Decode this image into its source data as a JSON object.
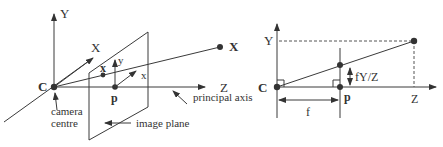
{
  "left_diagram": {
    "axis_labels": {
      "y": "Y",
      "x": "X",
      "z": "Z"
    },
    "camera_centre_point": "C",
    "principal_point": "p",
    "world_point": "X",
    "image_point": "x",
    "image_axes": {
      "x": "x",
      "y": "y"
    },
    "annotations": {
      "camera_centre": [
        "camera",
        "centre"
      ],
      "image_plane": "image plane",
      "principal_axis": "principal axis"
    }
  },
  "right_diagram": {
    "axis_labels": {
      "y": "Y",
      "z": "Z"
    },
    "camera_centre_point": "C",
    "principal_point": "p",
    "focal_length": "f",
    "projection": "fY/Z"
  }
}
